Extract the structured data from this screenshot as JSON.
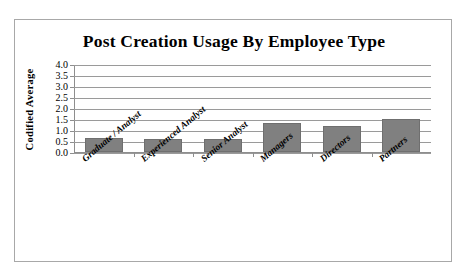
{
  "chart_data": {
    "type": "bar",
    "title": "Post Creation Usage By Employee Type",
    "xlabel": "",
    "ylabel": "Codified Average",
    "categories": [
      "Graduate / Analyst",
      "Experienced Analyst",
      "Senior Analyst",
      "Managers",
      "Directors",
      "Partners"
    ],
    "values": [
      0.65,
      0.6,
      0.6,
      1.3,
      1.2,
      1.5
    ],
    "ylim": [
      0.0,
      4.0
    ],
    "ytick_labels": [
      "4.0",
      "3.5",
      "3.0",
      "2.5",
      "2.0",
      "1.5",
      "1.0",
      "0.5",
      "0.0"
    ],
    "ytick_values": [
      4.0,
      3.5,
      3.0,
      2.5,
      2.0,
      1.5,
      1.0,
      0.5,
      0.0
    ],
    "grid": true,
    "legend": "none",
    "series": [
      {
        "name": "Codified Average",
        "color": "#808080",
        "values": [
          0.65,
          0.6,
          0.6,
          1.3,
          1.2,
          1.5
        ]
      }
    ]
  },
  "frame": {
    "border_color": "#a8a8a8",
    "background": "#ffffff"
  }
}
